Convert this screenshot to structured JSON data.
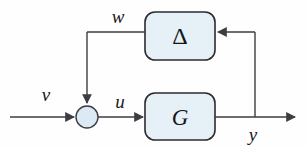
{
  "diagram": {
    "type": "block-diagram",
    "background_color": "#fefefe",
    "line_color": "#3c3c42",
    "block_fill_color": "#e6f0f7",
    "block_border_color": "#2b2b30",
    "junction_fill_color": "#dceaf5",
    "blocks": [
      {
        "id": "delta",
        "label": "Δ",
        "name": "delta-block",
        "x": 145,
        "y": 12,
        "width": 70,
        "height": 48,
        "corner_radius": 10
      },
      {
        "id": "g",
        "label": "G",
        "name": "plant-block",
        "x": 145,
        "y": 93,
        "width": 70,
        "height": 47,
        "corner_radius": 10
      }
    ],
    "junction": {
      "id": "sum",
      "name": "summing-junction",
      "cx": 87,
      "cy": 117,
      "r": 11
    },
    "signals": [
      {
        "id": "v",
        "label": "v",
        "name": "signal-label-v",
        "x": 46,
        "y": 101
      },
      {
        "id": "w",
        "label": "w",
        "name": "signal-label-w",
        "x": 118,
        "y": 23
      },
      {
        "id": "u",
        "label": "u",
        "name": "signal-label-u",
        "x": 120,
        "y": 106
      },
      {
        "id": "y",
        "label": "y",
        "name": "signal-label-y",
        "x": 253,
        "y": 140
      }
    ],
    "edges": [
      {
        "id": "v-to-sum",
        "from": "input",
        "to": "sum",
        "label": "v"
      },
      {
        "id": "sum-to-g",
        "from": "sum",
        "to": "g",
        "label": "u"
      },
      {
        "id": "g-to-output",
        "from": "g",
        "to": "output",
        "label": "y"
      },
      {
        "id": "y-to-delta",
        "from": "y-branch",
        "to": "delta",
        "label": ""
      },
      {
        "id": "delta-to-sum",
        "from": "delta",
        "to": "sum",
        "label": "w"
      }
    ]
  }
}
